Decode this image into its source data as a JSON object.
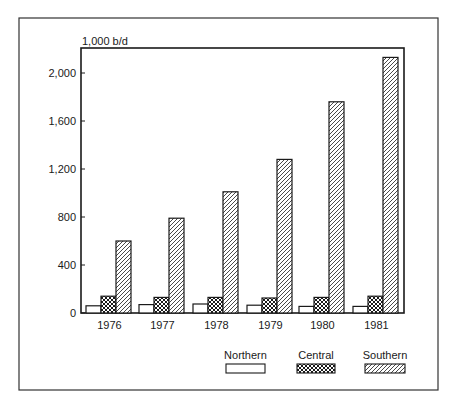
{
  "chart_data": {
    "type": "bar",
    "title": "",
    "unit_label": "1,000 b/d",
    "xlabel": "",
    "ylabel": "1,000 b/d",
    "ylim": [
      0,
      2200
    ],
    "yticks": [
      0,
      400,
      800,
      1200,
      1600,
      2000
    ],
    "ytick_labels": [
      "0",
      "400",
      "800",
      "1,200",
      "1,600",
      "2,000"
    ],
    "grid": false,
    "legend_position": "bottom-right",
    "categories": [
      "1976",
      "1977",
      "1978",
      "1979",
      "1980",
      "1981"
    ],
    "series": [
      {
        "name": "Northern",
        "pattern": "blank",
        "values": [
          60,
          70,
          75,
          65,
          55,
          55
        ]
      },
      {
        "name": "Central",
        "pattern": "crosshatch",
        "values": [
          140,
          130,
          130,
          125,
          130,
          140
        ]
      },
      {
        "name": "Southern",
        "pattern": "diagonal",
        "values": [
          600,
          790,
          1010,
          1280,
          1760,
          2130
        ]
      }
    ]
  },
  "colors": {
    "ink": "#1a1a1a",
    "background": "#ffffff"
  }
}
